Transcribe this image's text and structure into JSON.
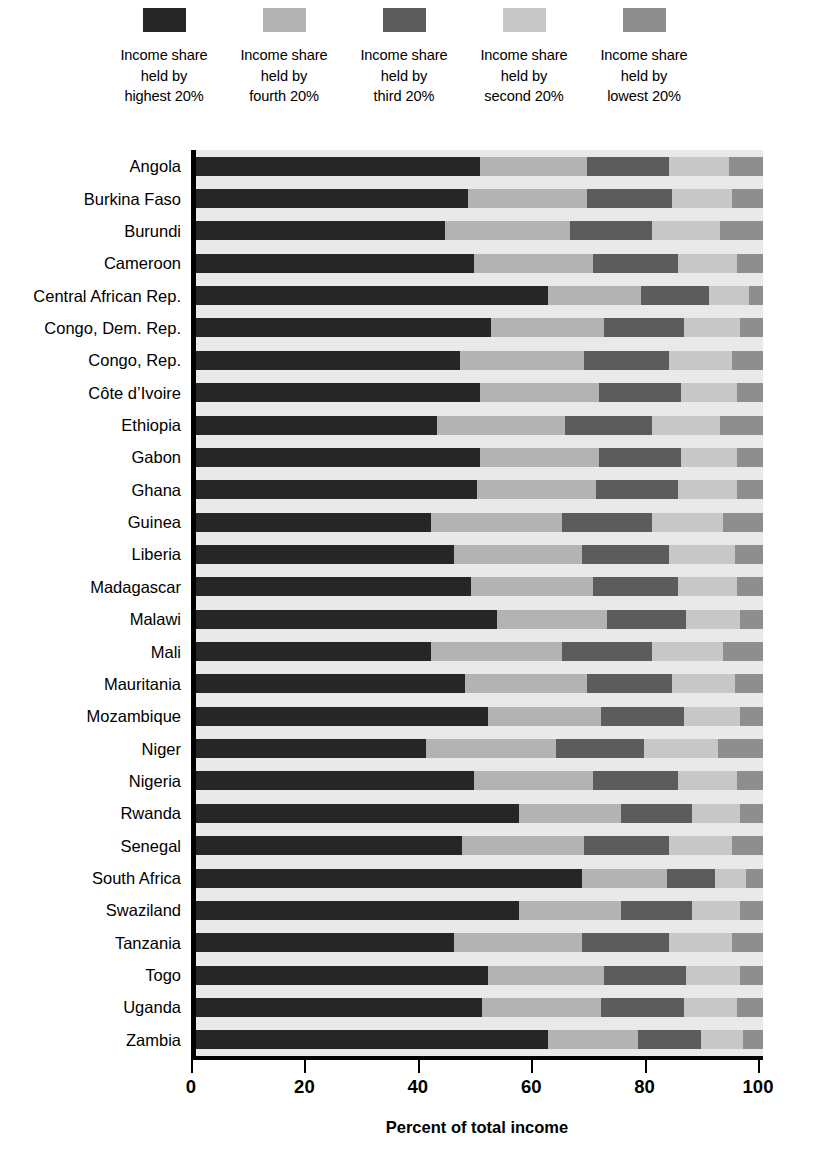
{
  "legend": {
    "items": [
      {
        "label": "Income share\nheld by\nhighest 20%",
        "color": "#262626",
        "key": "highest"
      },
      {
        "label": "Income share\nheld by\nfourth 20%",
        "color": "#b3b3b3",
        "key": "fourth"
      },
      {
        "label": "Income share\nheld by\nthird 20%",
        "color": "#5c5c5c",
        "key": "third"
      },
      {
        "label": "Income share\nheld by\nsecond 20%",
        "color": "#c7c7c7",
        "key": "second"
      },
      {
        "label": "Income share\nheld by\nlowest 20%",
        "color": "#8e8e8e",
        "key": "lowest"
      }
    ]
  },
  "axis": {
    "x_title": "Percent of total income",
    "x_ticks": [
      "0",
      "20",
      "40",
      "60",
      "80",
      "100"
    ]
  },
  "chart_data": {
    "type": "bar",
    "orientation": "horizontal",
    "stacked": true,
    "title": "",
    "subtitle": "",
    "xlabel": "Percent of total income",
    "ylabel": "",
    "xlim": [
      0,
      100
    ],
    "xticks": [
      0,
      20,
      40,
      60,
      80,
      100
    ],
    "grid": false,
    "legend_position": "top",
    "legend": [
      "Income share held by highest 20%",
      "Income share held by fourth 20%",
      "Income share held by third 20%",
      "Income share held by second 20%",
      "Income share held by lowest 20%"
    ],
    "colors": [
      "#262626",
      "#b3b3b3",
      "#5c5c5c",
      "#c7c7c7",
      "#8e8e8e"
    ],
    "categories": [
      "Angola",
      "Burkina Faso",
      "Burundi",
      "Cameroon",
      "Central African Rep.",
      "Congo, Dem. Rep.",
      "Congo, Rep.",
      "Côte d’Ivoire",
      "Ethiopia",
      "Gabon",
      "Ghana",
      "Guinea",
      "Liberia",
      "Madagascar",
      "Malawi",
      "Mali",
      "Mauritania",
      "Mozambique",
      "Niger",
      "Nigeria",
      "Rwanda",
      "Senegal",
      "South Africa",
      "Swaziland",
      "Tanzania",
      "Togo",
      "Uganda",
      "Zambia"
    ],
    "series": [
      {
        "name": "Income share held by highest 20%",
        "values": [
          50.0,
          48.0,
          44.0,
          49.0,
          62.0,
          52.0,
          46.5,
          50.0,
          42.5,
          50.0,
          49.5,
          41.5,
          45.5,
          48.5,
          53.0,
          41.5,
          47.5,
          51.5,
          40.5,
          49.0,
          57.0,
          47.0,
          68.0,
          57.0,
          45.5,
          51.5,
          50.5,
          62.0
        ]
      },
      {
        "name": "Income share held by fourth 20%",
        "values": [
          19.0,
          21.0,
          22.0,
          21.0,
          16.5,
          20.0,
          22.0,
          21.0,
          22.5,
          21.0,
          21.0,
          23.0,
          22.5,
          21.5,
          19.5,
          23.0,
          21.5,
          20.0,
          23.0,
          21.0,
          18.0,
          21.5,
          15.0,
          18.0,
          22.5,
          20.5,
          21.0,
          16.0
        ]
      },
      {
        "name": "Income share held by third 20%",
        "values": [
          14.5,
          15.0,
          14.5,
          15.0,
          12.0,
          14.0,
          15.0,
          14.5,
          15.5,
          14.5,
          14.5,
          16.0,
          15.5,
          15.0,
          14.0,
          16.0,
          15.0,
          14.5,
          15.5,
          15.0,
          12.5,
          15.0,
          8.5,
          12.5,
          15.5,
          14.5,
          14.5,
          11.0
        ]
      },
      {
        "name": "Income share held by second 20%",
        "values": [
          10.5,
          10.5,
          12.0,
          10.5,
          7.0,
          10.0,
          11.0,
          10.0,
          12.0,
          10.0,
          10.5,
          12.5,
          11.5,
          10.5,
          9.5,
          12.5,
          11.0,
          10.0,
          13.0,
          10.5,
          8.5,
          11.0,
          5.5,
          8.5,
          11.0,
          9.5,
          9.5,
          7.5
        ]
      },
      {
        "name": "Income share held by lowest 20%",
        "values": [
          6.0,
          5.5,
          7.5,
          4.5,
          2.5,
          4.0,
          5.5,
          4.5,
          7.5,
          4.5,
          4.5,
          7.0,
          5.0,
          4.5,
          4.0,
          7.0,
          5.0,
          4.0,
          8.0,
          4.5,
          4.0,
          5.5,
          3.0,
          4.0,
          5.5,
          4.0,
          4.5,
          3.5
        ]
      }
    ]
  }
}
